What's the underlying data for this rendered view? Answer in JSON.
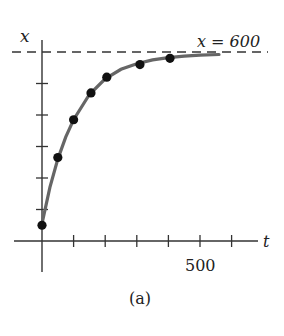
{
  "chart_data": {
    "type": "scatter",
    "title": "",
    "caption": "(a)",
    "xlabel": "t",
    "ylabel": "x",
    "xlim": [
      0,
      650
    ],
    "ylim": [
      0,
      630
    ],
    "x_ticks": [
      100,
      200,
      300,
      400,
      500,
      600
    ],
    "x_tick_labels": {
      "500": "500"
    },
    "y_ticks": [
      100,
      200,
      300,
      400,
      500
    ],
    "grid": false,
    "legend": null,
    "series": [
      {
        "name": "data points",
        "type": "scatter",
        "x": [
          0,
          50,
          100,
          155,
          205,
          310,
          405
        ],
        "y": [
          50,
          265,
          385,
          470,
          520,
          560,
          580
        ]
      },
      {
        "name": "fitted curve",
        "type": "line",
        "description": "logistic-type growth curve approaching x = 600",
        "x": [
          0,
          25,
          50,
          75,
          100,
          150,
          200,
          250,
          300,
          350,
          400,
          450,
          500,
          560
        ],
        "y": [
          55,
          170,
          260,
          330,
          385,
          465,
          515,
          545,
          563,
          575,
          582,
          587,
          590,
          592
        ]
      }
    ],
    "annotations": [
      {
        "type": "hline",
        "y": 600,
        "style": "dashed",
        "label": "x = 600"
      }
    ]
  },
  "labels": {
    "y_axis": "x",
    "x_axis": "t",
    "x_tick_500": "500",
    "asymptote": "x = 600",
    "caption": "(a)"
  }
}
